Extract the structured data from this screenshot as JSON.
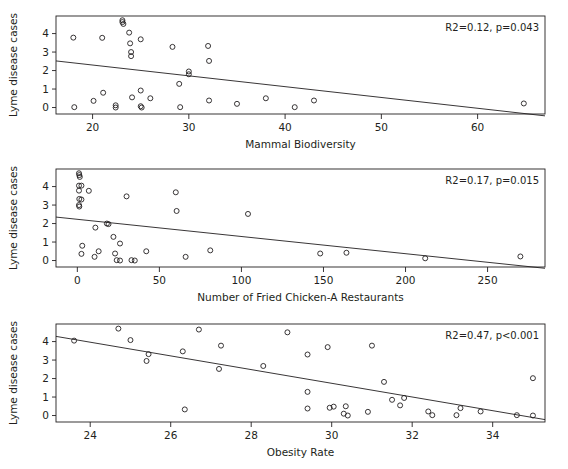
{
  "figure": {
    "ylabel": "Lyme disease cases",
    "point_marker": "open-circle",
    "line_color": "#231f20",
    "marker_color": "#231f20",
    "background": "#ffffff"
  },
  "chart_data": [
    {
      "type": "scatter",
      "title": "",
      "xlabel": "Mammal Biodiversity",
      "ylabel": "Lyme disease cases",
      "annotation": "R2=0.12, p=0.043",
      "r2": 0.12,
      "p_text": "p=0.043",
      "xlim": [
        16.2,
        67.0
      ],
      "ylim": [
        -0.35,
        4.95
      ],
      "xticks": [
        20,
        30,
        40,
        50,
        60
      ],
      "yticks": [
        0,
        1,
        2,
        3,
        4
      ],
      "grid": false,
      "legend": "none",
      "trendline": {
        "x": [
          16.2,
          67.0
        ],
        "y": [
          2.52,
          -0.45
        ]
      },
      "points": [
        {
          "x": 18.0,
          "y": 3.78
        },
        {
          "x": 18.1,
          "y": 0.02
        },
        {
          "x": 20.1,
          "y": 0.36
        },
        {
          "x": 21.0,
          "y": 3.77
        },
        {
          "x": 21.1,
          "y": 0.8
        },
        {
          "x": 22.4,
          "y": 0.12
        },
        {
          "x": 22.4,
          "y": 0.0
        },
        {
          "x": 23.1,
          "y": 4.72
        },
        {
          "x": 23.1,
          "y": 4.62
        },
        {
          "x": 23.2,
          "y": 4.52
        },
        {
          "x": 23.8,
          "y": 4.05
        },
        {
          "x": 23.9,
          "y": 3.47
        },
        {
          "x": 24.0,
          "y": 3.0
        },
        {
          "x": 24.0,
          "y": 2.78
        },
        {
          "x": 24.1,
          "y": 0.55
        },
        {
          "x": 25.0,
          "y": 3.69
        },
        {
          "x": 25.0,
          "y": 0.92
        },
        {
          "x": 25.0,
          "y": 0.07
        },
        {
          "x": 25.1,
          "y": 0.0
        },
        {
          "x": 26.0,
          "y": 0.5
        },
        {
          "x": 28.3,
          "y": 3.28
        },
        {
          "x": 29.0,
          "y": 1.28
        },
        {
          "x": 29.1,
          "y": 0.02
        },
        {
          "x": 30.0,
          "y": 1.95
        },
        {
          "x": 30.0,
          "y": 1.8
        },
        {
          "x": 32.0,
          "y": 3.33
        },
        {
          "x": 32.1,
          "y": 2.52
        },
        {
          "x": 32.1,
          "y": 0.38
        },
        {
          "x": 35.0,
          "y": 0.2
        },
        {
          "x": 38.0,
          "y": 0.5
        },
        {
          "x": 41.0,
          "y": 0.02
        },
        {
          "x": 43.0,
          "y": 0.38
        },
        {
          "x": 64.8,
          "y": 0.22
        }
      ]
    },
    {
      "type": "scatter",
      "title": "",
      "xlabel": "Number of Fried Chicken-A Restaurants",
      "ylabel": "Lyme disease cases",
      "annotation": "R2=0.17, p=0.015",
      "r2": 0.17,
      "p_text": "p=0.015",
      "xlim": [
        -13,
        285
      ],
      "ylim": [
        -0.35,
        4.95
      ],
      "xticks": [
        0,
        50,
        100,
        150,
        200,
        250
      ],
      "yticks": [
        0,
        1,
        2,
        3,
        4
      ],
      "grid": false,
      "legend": "none",
      "trendline": {
        "x": [
          -13,
          285
        ],
        "y": [
          2.35,
          -0.42
        ]
      },
      "points": [
        {
          "x": 1.0,
          "y": 4.72
        },
        {
          "x": 1.2,
          "y": 4.62
        },
        {
          "x": 1.5,
          "y": 4.52
        },
        {
          "x": 1.0,
          "y": 4.05
        },
        {
          "x": 2.5,
          "y": 4.05
        },
        {
          "x": 1.0,
          "y": 3.78
        },
        {
          "x": 7.0,
          "y": 3.77
        },
        {
          "x": 1.2,
          "y": 3.33
        },
        {
          "x": 2.5,
          "y": 3.3
        },
        {
          "x": 1.0,
          "y": 3.0
        },
        {
          "x": 1.2,
          "y": 2.92
        },
        {
          "x": 18.0,
          "y": 2.0
        },
        {
          "x": 19.0,
          "y": 1.97
        },
        {
          "x": 11.0,
          "y": 1.78
        },
        {
          "x": 22.0,
          "y": 1.28
        },
        {
          "x": 26.0,
          "y": 0.92
        },
        {
          "x": 3.0,
          "y": 0.8
        },
        {
          "x": 2.5,
          "y": 0.36
        },
        {
          "x": 13.0,
          "y": 0.5
        },
        {
          "x": 10.5,
          "y": 0.2
        },
        {
          "x": 23.0,
          "y": 0.38
        },
        {
          "x": 24.0,
          "y": 0.02
        },
        {
          "x": 26.0,
          "y": 0.0
        },
        {
          "x": 33.0,
          "y": 0.02
        },
        {
          "x": 35.0,
          "y": 0.0
        },
        {
          "x": 42.0,
          "y": 0.5
        },
        {
          "x": 30.0,
          "y": 3.47
        },
        {
          "x": 60.0,
          "y": 3.69
        },
        {
          "x": 60.5,
          "y": 2.68
        },
        {
          "x": 66.0,
          "y": 0.2
        },
        {
          "x": 81.0,
          "y": 0.55
        },
        {
          "x": 104.0,
          "y": 2.52
        },
        {
          "x": 148.0,
          "y": 0.38
        },
        {
          "x": 164.0,
          "y": 0.42
        },
        {
          "x": 212.0,
          "y": 0.12
        },
        {
          "x": 270.0,
          "y": 0.22
        }
      ]
    },
    {
      "type": "scatter",
      "title": "",
      "xlabel": "Obesity Rate",
      "ylabel": "Lyme disease cases",
      "annotation": "R2=0.47, p<0.001",
      "r2": 0.47,
      "p_text": "p<0.001",
      "xlim": [
        23.15,
        35.3
      ],
      "ylim": [
        -0.35,
        4.95
      ],
      "xticks": [
        24,
        26,
        28,
        30,
        32,
        34
      ],
      "yticks": [
        0,
        1,
        2,
        3,
        4
      ],
      "grid": false,
      "legend": "none",
      "trendline": {
        "x": [
          23.15,
          35.3
        ],
        "y": [
          4.28,
          -0.22
        ]
      },
      "points": [
        {
          "x": 23.6,
          "y": 4.05
        },
        {
          "x": 24.7,
          "y": 4.7
        },
        {
          "x": 25.0,
          "y": 4.08
        },
        {
          "x": 25.45,
          "y": 3.32
        },
        {
          "x": 25.4,
          "y": 2.95
        },
        {
          "x": 26.3,
          "y": 3.47
        },
        {
          "x": 26.35,
          "y": 0.33
        },
        {
          "x": 26.7,
          "y": 4.65
        },
        {
          "x": 27.25,
          "y": 3.78
        },
        {
          "x": 27.2,
          "y": 2.52
        },
        {
          "x": 28.3,
          "y": 2.68
        },
        {
          "x": 28.9,
          "y": 4.5
        },
        {
          "x": 29.4,
          "y": 3.3
        },
        {
          "x": 29.4,
          "y": 1.28
        },
        {
          "x": 29.4,
          "y": 0.38
        },
        {
          "x": 29.9,
          "y": 3.7
        },
        {
          "x": 29.95,
          "y": 0.42
        },
        {
          "x": 30.05,
          "y": 0.48
        },
        {
          "x": 30.3,
          "y": 0.1
        },
        {
          "x": 30.35,
          "y": 0.5
        },
        {
          "x": 30.4,
          "y": 0.0
        },
        {
          "x": 30.9,
          "y": 0.2
        },
        {
          "x": 31.0,
          "y": 3.78
        },
        {
          "x": 31.3,
          "y": 1.82
        },
        {
          "x": 31.5,
          "y": 0.85
        },
        {
          "x": 31.7,
          "y": 0.55
        },
        {
          "x": 31.8,
          "y": 0.95
        },
        {
          "x": 32.4,
          "y": 0.22
        },
        {
          "x": 32.5,
          "y": 0.02
        },
        {
          "x": 33.1,
          "y": 0.02
        },
        {
          "x": 33.2,
          "y": 0.4
        },
        {
          "x": 33.7,
          "y": 0.22
        },
        {
          "x": 34.6,
          "y": 0.02
        },
        {
          "x": 35.0,
          "y": 2.02
        },
        {
          "x": 35.0,
          "y": 0.0
        }
      ]
    }
  ]
}
